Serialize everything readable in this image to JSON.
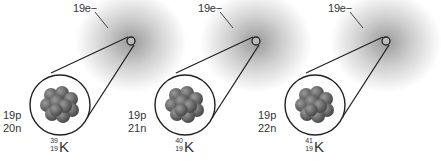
{
  "diagram": {
    "colors": {
      "cloud": "#8a8a8a",
      "outline": "#222222",
      "nucleus": "#6e6e6e"
    },
    "isotopes": [
      {
        "electrons": "19e−",
        "protons": "19p",
        "neutrons": "20n",
        "mass_number": "39",
        "atomic_number": "19",
        "symbol": "K"
      },
      {
        "electrons": "19e−",
        "protons": "19p",
        "neutrons": "21n",
        "mass_number": "40",
        "atomic_number": "19",
        "symbol": "K"
      },
      {
        "electrons": "19e−",
        "protons": "19p",
        "neutrons": "22n",
        "mass_number": "41",
        "atomic_number": "19",
        "symbol": "K"
      }
    ]
  }
}
